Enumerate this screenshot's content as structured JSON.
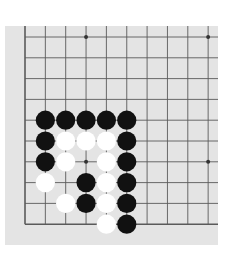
{
  "board": {
    "background": "#e4e4e4",
    "line_color": "#5a5a5a",
    "cols": 10,
    "rows": 10,
    "origin_x": 20,
    "origin_y": 11,
    "spacing_x": 20.35,
    "spacing_y": 20.8,
    "extends_right": true,
    "extends_top": true,
    "edges": [
      "left",
      "bottom"
    ],
    "star_points": [
      [
        3,
        0
      ],
      [
        9,
        0
      ],
      [
        3,
        6
      ],
      [
        9,
        6
      ]
    ]
  },
  "stones": {
    "black": [
      [
        1,
        4
      ],
      [
        2,
        4
      ],
      [
        3,
        4
      ],
      [
        4,
        4
      ],
      [
        5,
        4
      ],
      [
        1,
        5
      ],
      [
        5,
        5
      ],
      [
        1,
        6
      ],
      [
        5,
        6
      ],
      [
        3,
        7
      ],
      [
        5,
        7
      ],
      [
        3,
        8
      ],
      [
        5,
        8
      ],
      [
        5,
        9
      ]
    ],
    "white": [
      [
        2,
        5
      ],
      [
        3,
        5
      ],
      [
        4,
        5
      ],
      [
        2,
        6
      ],
      [
        4,
        6
      ],
      [
        1,
        7
      ],
      [
        4,
        7
      ],
      [
        2,
        8
      ],
      [
        4,
        8
      ],
      [
        4,
        9
      ]
    ]
  },
  "colors": {
    "black": "#111111",
    "white": "#ffffff"
  }
}
